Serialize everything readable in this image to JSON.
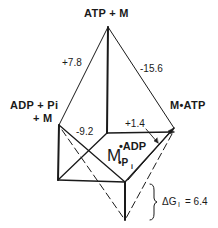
{
  "diagram": {
    "nodes": {
      "top": "ATP + M",
      "left_line1": "ADP + Pi",
      "left_line2": "+ M",
      "right": "M•ATP",
      "center_main": "M",
      "center_sup": "•ADP",
      "center_sub": "•P",
      "center_sub_i": "i"
    },
    "edges": {
      "top_left": "+7.8",
      "top_right": "-15.6",
      "left_back": "-9.2",
      "back_right": "+1.4"
    },
    "annotation": {
      "delta": "ΔG",
      "subscript": "I",
      "value": "= 6.4"
    },
    "colors": {
      "ink": "#1a1a1a",
      "background": "#ffffff"
    }
  }
}
